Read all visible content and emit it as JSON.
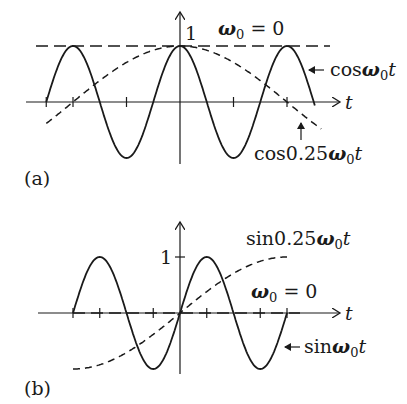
{
  "panels": [
    {
      "id": "a",
      "caption": "(a)",
      "x_axis_label": "t",
      "y_tick_label": "1",
      "labels": {
        "omega_zero": {
          "sym": "ω",
          "sub": "0",
          "rest": " = 0"
        },
        "fast": {
          "pre": "cos",
          "sym": "ω",
          "sub": "0",
          "post": "t"
        },
        "slow": {
          "pre": "cos0.25",
          "sym": "ω",
          "sub": "0",
          "post": "t"
        }
      }
    },
    {
      "id": "b",
      "caption": "(b)",
      "x_axis_label": "t",
      "y_tick_label": "1",
      "labels": {
        "omega_zero": {
          "sym": "ω",
          "sub": "0",
          "rest": " = 0"
        },
        "fast": {
          "pre": "sin",
          "sym": "ω",
          "sub": "0",
          "post": "t"
        },
        "slow": {
          "pre": "sin0.25",
          "sym": "ω",
          "sub": "0",
          "post": "t"
        }
      }
    }
  ],
  "chart_data": [
    {
      "type": "line",
      "title": "(a)",
      "xlabel": "t",
      "ylabel": "",
      "x_range_periods": [
        -1.25,
        1.25
      ],
      "ylim": [
        -1,
        1
      ],
      "y_ticks": [
        1
      ],
      "series": [
        {
          "name": "cos ω0 t",
          "style": "solid",
          "function": "cos(2π x)",
          "x_range": [
            -1.25,
            1.25
          ]
        },
        {
          "name": "cos 0.25 ω0 t",
          "style": "dashed",
          "function": "cos(0.25·2π x)",
          "x_range": [
            -1.25,
            1.3
          ]
        },
        {
          "name": "ω0 = 0",
          "style": "dashed",
          "function": "1",
          "x_range": [
            -1.25,
            1.4
          ]
        }
      ],
      "annotations": [
        "1",
        "ω0 = 0",
        "cos ω0 t",
        "cos 0.25 ω0 t"
      ]
    },
    {
      "type": "line",
      "title": "(b)",
      "xlabel": "t",
      "ylabel": "",
      "ylim": [
        -1,
        1
      ],
      "y_ticks": [
        1
      ],
      "series": [
        {
          "name": "sin ω0 t",
          "style": "solid",
          "function": "sin(2π x)",
          "x_range": [
            -1.0,
            1.0
          ]
        },
        {
          "name": "sin 0.25 ω0 t",
          "style": "dashed",
          "function": "sin(0.25·2π x)",
          "x_range": [
            -1.0,
            1.0
          ]
        },
        {
          "name": "ω0 = 0",
          "style": "dashed",
          "function": "0",
          "x_range": [
            -1.0,
            1.0
          ]
        }
      ],
      "annotations": [
        "1",
        "ω0 = 0",
        "sin ω0 t",
        "sin 0.25 ω0 t"
      ]
    }
  ]
}
